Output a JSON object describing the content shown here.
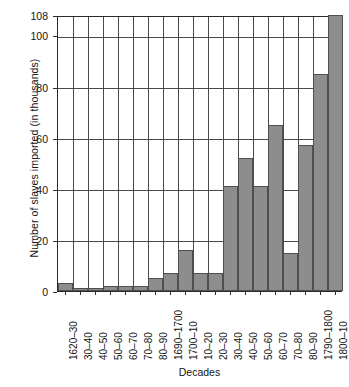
{
  "chart_data": {
    "type": "bar",
    "title": "",
    "xlabel": "Decades",
    "ylabel": "Number of slaves imported (in thousands)",
    "categories": [
      "1620–30",
      "30–40",
      "40–50",
      "50–60",
      "60–70",
      "70–80",
      "80–90",
      "1690–1700",
      "1700–10",
      "10–20",
      "20–30",
      "30–40",
      "40–50",
      "50–60",
      "60–70",
      "70–80",
      "80–90",
      "1790–1800",
      "1800–10"
    ],
    "values": [
      3,
      1,
      1,
      2,
      2,
      2,
      5,
      7,
      16,
      7,
      7,
      41,
      52,
      41,
      65,
      15,
      57,
      85,
      108
    ],
    "ylim": [
      0,
      108
    ],
    "yticks": [
      0,
      20,
      40,
      60,
      80,
      100,
      108
    ],
    "ytick_labels": [
      "0",
      "20",
      "40",
      "60",
      "80",
      "100",
      "108"
    ],
    "grid": "both",
    "legend": "none",
    "bar_color": "#8d8d8d",
    "bar_edge_color": "#4f4f4f",
    "axis_color": "#2b2b2b",
    "background": "#ffffff"
  }
}
